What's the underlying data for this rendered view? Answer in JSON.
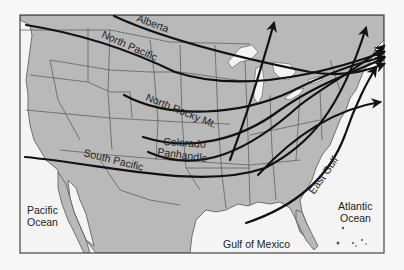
{
  "map": {
    "title": "Storm tracks across North America",
    "colors": {
      "land": "#b9b9b9",
      "water": "#f4f4f4",
      "border": "#555555",
      "frame": "#444444",
      "track": "#111111"
    },
    "storm_tracks": [
      {
        "id": "alberta",
        "label": "Alberta"
      },
      {
        "id": "north-pacific",
        "label": "North Pacific"
      },
      {
        "id": "north-rocky",
        "label": "North Rocky Mt."
      },
      {
        "id": "colorado",
        "label": "Colorado"
      },
      {
        "id": "panhandle",
        "label": "Panhandle"
      },
      {
        "id": "south-pacific",
        "label": "South Pacific"
      },
      {
        "id": "east-gulf",
        "label": "East Gulf"
      }
    ],
    "water_bodies": {
      "pacific_line1": "Pacific",
      "pacific_line2": "Ocean",
      "atlantic_line1": "Atlantic",
      "atlantic_line2": "Ocean",
      "gulf": "Gulf of Mexico"
    }
  }
}
